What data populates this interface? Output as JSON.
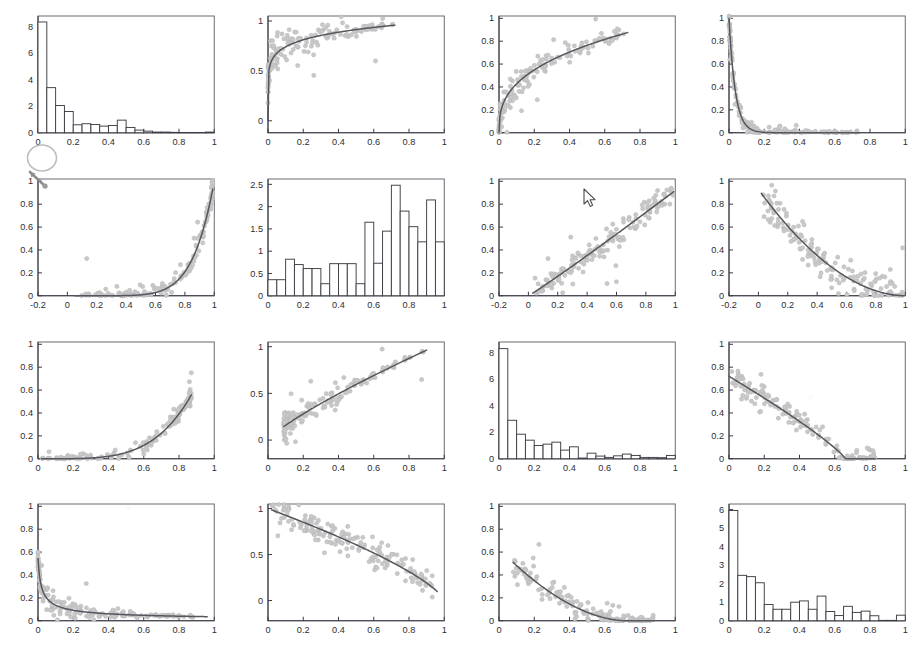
{
  "figure": {
    "type": "scatter-plot-matrix",
    "rows": 4,
    "cols": 4,
    "background_color": "#ffffff",
    "point_color": "#c9c9c9",
    "curve_color": "#56565e",
    "axis_color": "#3b3b45",
    "bar_fill": "#ffffff",
    "bar_stroke": "#3d3d45"
  },
  "cursor": {
    "name": "mouse-arrow-cursor",
    "x": 583,
    "y": 188
  },
  "annotation": {
    "name": "handdrawn-circle-arrow",
    "x": 20,
    "y": 138
  },
  "chart_data": [
    {
      "id": "p11",
      "row": 1,
      "col": 1,
      "type": "bar",
      "title": "",
      "xlabel": "",
      "ylabel": "",
      "xlim": [
        0,
        1
      ],
      "ylim": [
        0,
        8.8
      ],
      "xticks": [
        0,
        0.2,
        0.4,
        0.6,
        0.8,
        1
      ],
      "xticklabels": [
        "0",
        "0.2",
        "0.4",
        "0.6",
        "0.8",
        "1"
      ],
      "yticks": [
        0,
        2,
        4,
        6,
        8
      ],
      "yticklabels": [
        "0",
        "2",
        "4",
        "6",
        "8"
      ],
      "bin_edges": [
        0,
        0.05,
        0.1,
        0.15,
        0.2,
        0.25,
        0.3,
        0.35,
        0.4,
        0.45,
        0.5,
        0.55,
        0.6,
        0.65,
        0.7,
        0.75,
        0.8,
        0.85,
        0.9,
        0.95,
        1
      ],
      "values": [
        8.35,
        3.4,
        2.05,
        1.6,
        0.6,
        0.68,
        0.62,
        0.5,
        0.55,
        0.95,
        0.4,
        0.2,
        0.12,
        0.05,
        0.05,
        0.03,
        0.02,
        0.02,
        0.02,
        0.05
      ]
    },
    {
      "id": "p12",
      "row": 1,
      "col": 2,
      "type": "scatter",
      "title": "",
      "xlabel": "",
      "ylabel": "",
      "xlim": [
        0,
        1
      ],
      "ylim": [
        -0.12,
        1.05
      ],
      "xticks": [
        0,
        0.2,
        0.4,
        0.6,
        0.8,
        1
      ],
      "xticklabels": [
        "0",
        "0.2",
        "0.4",
        "0.6",
        "0.8",
        "1"
      ],
      "yticks": [
        0,
        0.5,
        1
      ],
      "yticklabels": [
        "0",
        "0.5",
        "1"
      ],
      "shape": "concave-increasing-saturating",
      "fit": {
        "kind": "power",
        "expr": "y = x^0.13",
        "exponent": 0.13
      },
      "n_points": 150,
      "x_range_points": [
        0.0,
        0.72
      ],
      "noise": 0.09
    },
    {
      "id": "p13",
      "row": 1,
      "col": 3,
      "type": "scatter",
      "title": "",
      "xlabel": "",
      "ylabel": "",
      "xlim": [
        0,
        1
      ],
      "ylim": [
        0,
        1.02
      ],
      "xticks": [
        0,
        0.2,
        0.4,
        0.6,
        0.8,
        1
      ],
      "xticklabels": [
        "0",
        "0.2",
        "0.4",
        "0.6",
        "0.8",
        "1"
      ],
      "yticks": [
        0,
        0.2,
        0.4,
        0.6,
        0.8,
        1
      ],
      "yticklabels": [
        "0",
        "0.2",
        "0.4",
        "0.6",
        "0.8",
        "1"
      ],
      "shape": "concave-increasing",
      "fit": {
        "kind": "power",
        "expr": "y = 0.98*x^0.36",
        "exponent": 0.36
      },
      "n_points": 150,
      "x_range_points": [
        0.0,
        0.73
      ],
      "noise": 0.07
    },
    {
      "id": "p14",
      "row": 1,
      "col": 4,
      "type": "scatter",
      "title": "",
      "xlabel": "",
      "ylabel": "",
      "xlim": [
        0,
        1
      ],
      "ylim": [
        0,
        1.02
      ],
      "xticks": [
        0,
        0.2,
        0.4,
        0.6,
        0.8,
        1
      ],
      "xticklabels": [
        "0",
        "0.2",
        "0.4",
        "0.6",
        "0.8",
        "1"
      ],
      "yticks": [
        0,
        0.2,
        0.4,
        0.6,
        0.8,
        1
      ],
      "yticklabels": [
        "0",
        "0.2",
        "0.4",
        "0.6",
        "0.8",
        "1"
      ],
      "shape": "steep-decay",
      "fit": {
        "kind": "exponential-decay",
        "expr": "y = exp(-28x)",
        "rate": 28
      },
      "n_points": 150,
      "x_range_points": [
        0.0,
        0.74
      ],
      "noise": 0.05
    },
    {
      "id": "p21",
      "row": 2,
      "col": 1,
      "type": "scatter",
      "title": "",
      "xlabel": "",
      "ylabel": "",
      "xlim": [
        -0.2,
        1
      ],
      "ylim": [
        0,
        1.02
      ],
      "xticks": [
        -0.2,
        0,
        0.2,
        0.4,
        0.6,
        0.8,
        1
      ],
      "xticklabels": [
        "-0.2",
        "0",
        "0.2",
        "0.4",
        "0.6",
        "0.8",
        "1"
      ],
      "yticks": [
        0,
        0.2,
        0.4,
        0.6,
        0.8,
        1
      ],
      "yticklabels": [
        "0",
        "0.2",
        "0.4",
        "0.6",
        "0.8",
        "1"
      ],
      "shape": "convex-increasing",
      "fit": {
        "kind": "power",
        "expr": "y = x^7",
        "exponent": 7
      },
      "n_points": 150,
      "x_range_points": [
        0.05,
        0.99
      ],
      "noise": 0.05
    },
    {
      "id": "p22",
      "row": 2,
      "col": 2,
      "type": "bar",
      "title": "",
      "xlabel": "",
      "ylabel": "",
      "xlim": [
        0,
        1
      ],
      "ylim": [
        0,
        2.62
      ],
      "xticks": [
        0,
        0.2,
        0.4,
        0.6,
        0.8,
        1
      ],
      "xticklabels": [
        "0",
        "0.2",
        "0.4",
        "0.6",
        "0.8",
        "1"
      ],
      "yticks": [
        0,
        0.5,
        1,
        1.5,
        2,
        2.5
      ],
      "yticklabels": [
        "0",
        "0.5",
        "1",
        "1.5",
        "2",
        "2.5"
      ],
      "bin_edges": [
        0,
        0.05,
        0.1,
        0.15,
        0.2,
        0.25,
        0.3,
        0.35,
        0.4,
        0.45,
        0.5,
        0.55,
        0.6,
        0.65,
        0.7,
        0.75,
        0.8,
        0.85,
        0.9,
        0.95,
        1
      ],
      "values": [
        0.36,
        0.36,
        0.82,
        0.7,
        0.61,
        0.61,
        0.27,
        0.72,
        0.72,
        0.72,
        0.27,
        1.65,
        0.73,
        1.45,
        2.48,
        1.9,
        1.55,
        1.21,
        2.15,
        1.21
      ]
    },
    {
      "id": "p23",
      "row": 2,
      "col": 3,
      "type": "scatter",
      "title": "",
      "xlabel": "",
      "ylabel": "",
      "xlim": [
        -0.2,
        1
      ],
      "ylim": [
        0,
        1.02
      ],
      "xticks": [
        -0.2,
        0,
        0.2,
        0.4,
        0.6,
        0.8,
        1
      ],
      "xticklabels": [
        "-0.2",
        "0",
        "0.2",
        "0.4",
        "0.6",
        "0.8",
        "1"
      ],
      "yticks": [
        0,
        0.2,
        0.4,
        0.6,
        0.8,
        1
      ],
      "yticklabels": [
        "0",
        "0.2",
        "0.4",
        "0.6",
        "0.8",
        "1"
      ],
      "shape": "near-linear-increasing",
      "fit": {
        "kind": "power",
        "expr": "y = 0.92*x^1.05",
        "exponent": 1.05
      },
      "n_points": 160,
      "x_range_points": [
        0.03,
        0.99
      ],
      "noise": 0.05
    },
    {
      "id": "p24",
      "row": 2,
      "col": 4,
      "type": "scatter",
      "title": "",
      "xlabel": "",
      "ylabel": "",
      "xlim": [
        -0.2,
        1
      ],
      "ylim": [
        0,
        1.02
      ],
      "xticks": [
        -0.2,
        0,
        0.2,
        0.4,
        0.6,
        0.8,
        1
      ],
      "xticklabels": [
        "-0.2",
        "0",
        "0.2",
        "0.4",
        "0.6",
        "0.8",
        "1"
      ],
      "yticks": [
        0,
        0.2,
        0.4,
        0.6,
        0.8,
        1
      ],
      "yticklabels": [
        "0",
        "0.2",
        "0.4",
        "0.6",
        "0.8",
        "1"
      ],
      "shape": "concave-decreasing",
      "fit": {
        "kind": "quadratic-decay",
        "expr": "y = 0.93*(1-x)^1.9"
      },
      "n_points": 160,
      "x_range_points": [
        0.02,
        0.99
      ],
      "noise": 0.08
    },
    {
      "id": "p31",
      "row": 3,
      "col": 1,
      "type": "scatter",
      "title": "",
      "xlabel": "",
      "ylabel": "",
      "xlim": [
        0,
        1
      ],
      "ylim": [
        0,
        1.02
      ],
      "xticks": [
        0,
        0.2,
        0.4,
        0.6,
        0.8,
        1
      ],
      "xticklabels": [
        "0",
        "0.2",
        "0.4",
        "0.6",
        "0.8",
        "1"
      ],
      "yticks": [
        0,
        0.2,
        0.4,
        0.6,
        0.8,
        1
      ],
      "yticklabels": [
        "0",
        "0.2",
        "0.4",
        "0.6",
        "0.8",
        "1"
      ],
      "shape": "convex-increasing",
      "fit": {
        "kind": "power",
        "expr": "y = x^4.2",
        "exponent": 4.2
      },
      "n_points": 150,
      "x_range_points": [
        0.02,
        0.87
      ],
      "noise": 0.04
    },
    {
      "id": "p32",
      "row": 3,
      "col": 2,
      "type": "scatter",
      "title": "",
      "xlabel": "",
      "ylabel": "",
      "xlim": [
        0,
        1
      ],
      "ylim": [
        -0.2,
        1.05
      ],
      "xticks": [
        0,
        0.2,
        0.4,
        0.6,
        0.8,
        1
      ],
      "xticklabels": [
        "0",
        "0.2",
        "0.4",
        "0.6",
        "0.8",
        "1"
      ],
      "yticks": [
        0,
        0.5,
        1
      ],
      "yticklabels": [
        "0",
        "0.5",
        "1"
      ],
      "shape": "concave-increasing",
      "fit": {
        "kind": "power",
        "expr": "y = 1.05*x^0.82",
        "exponent": 0.82
      },
      "n_points": 155,
      "x_range_points": [
        0.09,
        0.9
      ],
      "noise": 0.07
    },
    {
      "id": "p33",
      "row": 3,
      "col": 3,
      "type": "bar",
      "title": "",
      "xlabel": "",
      "ylabel": "",
      "xlim": [
        0,
        1
      ],
      "ylim": [
        0,
        8.8
      ],
      "xticks": [
        0,
        0.2,
        0.4,
        0.6,
        0.8,
        1
      ],
      "xticklabels": [
        "0",
        "0.2",
        "0.4",
        "0.6",
        "0.8",
        "1"
      ],
      "yticks": [
        0,
        2,
        4,
        6,
        8
      ],
      "yticklabels": [
        "0",
        "2",
        "4",
        "6",
        "8"
      ],
      "bin_edges": [
        0,
        0.05,
        0.1,
        0.15,
        0.2,
        0.25,
        0.3,
        0.35,
        0.4,
        0.45,
        0.5,
        0.55,
        0.6,
        0.65,
        0.7,
        0.75,
        0.8,
        0.85,
        0.9,
        0.95,
        1
      ],
      "values": [
        8.3,
        2.9,
        1.85,
        1.4,
        1.0,
        1.1,
        1.25,
        0.65,
        0.9,
        0.05,
        0.42,
        0.2,
        0.1,
        0.22,
        0.35,
        0.25,
        0.1,
        0.1,
        0.08,
        0.25
      ]
    },
    {
      "id": "p34",
      "row": 3,
      "col": 4,
      "type": "scatter",
      "title": "",
      "xlabel": "",
      "ylabel": "",
      "xlim": [
        0,
        1
      ],
      "ylim": [
        0,
        1.02
      ],
      "xticks": [
        0,
        0.2,
        0.4,
        0.6,
        0.8,
        1
      ],
      "xticklabels": [
        "0",
        "0.2",
        "0.4",
        "0.6",
        "0.8",
        "1"
      ],
      "yticks": [
        0,
        0.2,
        0.4,
        0.6,
        0.8,
        1
      ],
      "yticklabels": [
        "0",
        "0.2",
        "0.4",
        "0.6",
        "0.8",
        "1"
      ],
      "shape": "decreasing-to-zero",
      "fit": {
        "kind": "power-decay",
        "expr": "y = 0.72*(1-x/0.66)^0.85"
      },
      "n_points": 150,
      "x_range_points": [
        0.0,
        0.83
      ],
      "noise": 0.07
    },
    {
      "id": "p41",
      "row": 4,
      "col": 1,
      "type": "scatter",
      "title": "",
      "xlabel": "",
      "ylabel": "",
      "xlim": [
        0,
        1
      ],
      "ylim": [
        0,
        1.02
      ],
      "xticks": [
        0,
        0.2,
        0.4,
        0.6,
        0.8,
        1
      ],
      "xticklabels": [
        "0",
        "0.2",
        "0.4",
        "0.6",
        "0.8",
        "1"
      ],
      "yticks": [
        0,
        0.2,
        0.4,
        0.6,
        0.8,
        1
      ],
      "yticklabels": [
        "0",
        "0.2",
        "0.4",
        "0.6",
        "0.8",
        "1"
      ],
      "shape": "steep-decay-long-tail",
      "fit": {
        "kind": "power-decay",
        "expr": "y = 0.035/(x+0.012)^0.62"
      },
      "n_points": 170,
      "x_range_points": [
        0.0,
        0.96
      ],
      "noise": 0.05
    },
    {
      "id": "p42",
      "row": 4,
      "col": 2,
      "type": "scatter",
      "title": "",
      "xlabel": "",
      "ylabel": "",
      "xlim": [
        0,
        1
      ],
      "ylim": [
        -0.22,
        1.05
      ],
      "xticks": [
        0,
        0.2,
        0.4,
        0.6,
        0.8,
        1
      ],
      "xticklabels": [
        "0",
        "0.2",
        "0.4",
        "0.6",
        "0.8",
        "1"
      ],
      "yticks": [
        0,
        0.5,
        1
      ],
      "yticklabels": [
        "0",
        "0.5",
        "1"
      ],
      "shape": "decreasing-near-linear",
      "fit": {
        "kind": "power-decay",
        "expr": "y = (1-x)^0.72"
      },
      "n_points": 165,
      "x_range_points": [
        0.02,
        0.96
      ],
      "noise": 0.08
    },
    {
      "id": "p43",
      "row": 4,
      "col": 3,
      "type": "scatter",
      "title": "",
      "xlabel": "",
      "ylabel": "",
      "xlim": [
        0,
        1
      ],
      "ylim": [
        0,
        1.02
      ],
      "xticks": [
        0,
        0.2,
        0.4,
        0.6,
        0.8,
        1
      ],
      "xticklabels": [
        "0",
        "0.2",
        "0.4",
        "0.6",
        "0.8",
        "1"
      ],
      "yticks": [
        0,
        0.2,
        0.4,
        0.6,
        0.8,
        1
      ],
      "yticklabels": [
        "0",
        "0.2",
        "0.4",
        "0.6",
        "0.8",
        "1"
      ],
      "shape": "convex-decreasing",
      "fit": {
        "kind": "quadratic-decay",
        "expr": "y = 0.63*(1-x/0.72)^1.8"
      },
      "n_points": 155,
      "x_range_points": [
        0.08,
        0.88
      ],
      "noise": 0.07
    },
    {
      "id": "p44",
      "row": 4,
      "col": 4,
      "type": "bar",
      "title": "",
      "xlabel": "",
      "ylabel": "",
      "xlim": [
        0,
        1
      ],
      "ylim": [
        0,
        6.3
      ],
      "xticks": [
        0,
        0.2,
        0.4,
        0.6,
        0.8,
        1
      ],
      "xticklabels": [
        "0",
        "0.2",
        "0.4",
        "0.6",
        "0.8",
        "1"
      ],
      "yticks": [
        0,
        1,
        2,
        3,
        4,
        5,
        6
      ],
      "yticklabels": [
        "0",
        "1",
        "2",
        "3",
        "4",
        "5",
        "6"
      ],
      "bin_edges": [
        0,
        0.05,
        0.1,
        0.15,
        0.2,
        0.25,
        0.3,
        0.35,
        0.4,
        0.45,
        0.5,
        0.55,
        0.6,
        0.65,
        0.7,
        0.75,
        0.8,
        0.85,
        0.9,
        0.95,
        1
      ],
      "values": [
        5.95,
        2.45,
        2.38,
        2.05,
        0.88,
        0.62,
        0.62,
        1.0,
        1.07,
        0.62,
        1.33,
        0.5,
        0.28,
        0.78,
        0.45,
        0.52,
        0.27,
        0.02,
        0.02,
        0.3,
        0.45
      ]
    }
  ]
}
